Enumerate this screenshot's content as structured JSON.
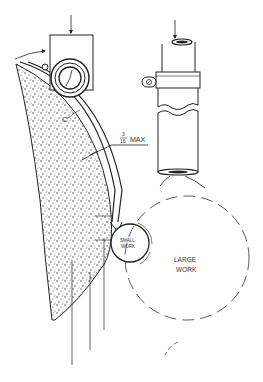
{
  "diagram": {
    "labels": {
      "dimension_fraction_numerator": "3",
      "dimension_fraction_denominator": "16",
      "dimension_max": "MAX",
      "small_work_line1": "SMALL",
      "small_work_line2": "WORK",
      "large_work_line1": "LARGE",
      "large_work_line2": "WORK",
      "callout_c": "C"
    },
    "colors": {
      "ink": "#222222",
      "background": "#ffffff"
    }
  }
}
